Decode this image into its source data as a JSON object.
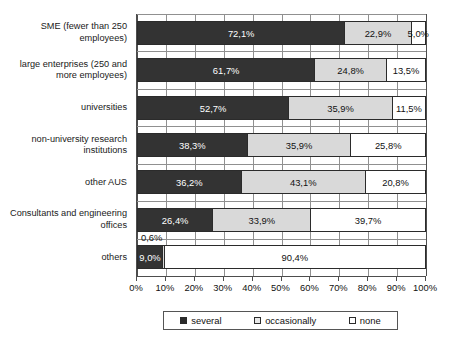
{
  "chart_data": {
    "type": "bar",
    "orientation": "horizontal",
    "stacked": true,
    "title": "",
    "subtitle": "",
    "xlabel": "",
    "ylabel": "",
    "xlim": [
      0,
      100
    ],
    "grid": true,
    "legend_position": "bottom",
    "categories": [
      "SME (fewer than 250 employees)",
      "large enterprises (250 and more employees)",
      "universities",
      "non-university research institutions",
      "other AUS",
      "Consultants and engineering offices",
      "others"
    ],
    "series": [
      {
        "name": "several",
        "values": [
          72.1,
          61.7,
          52.7,
          38.3,
          36.2,
          26.4,
          9.0
        ]
      },
      {
        "name": "occasionally",
        "values": [
          22.9,
          24.8,
          35.9,
          35.9,
          43.1,
          33.9,
          0.6
        ]
      },
      {
        "name": "none",
        "values": [
          5.0,
          13.5,
          11.5,
          25.8,
          20.8,
          39.7,
          90.4
        ]
      }
    ],
    "tick_labels": [
      "0%",
      "10%",
      "20%",
      "30%",
      "40%",
      "50%",
      "60%",
      "70%",
      "80%",
      "90%",
      "100%"
    ],
    "tick_values": [
      0,
      10,
      20,
      30,
      40,
      50,
      60,
      70,
      80,
      90,
      100
    ],
    "colors": {
      "several": "#333333",
      "occasionally": "#d9d9d9",
      "none": "#ffffff",
      "axis": "#4d4d4d",
      "grid": "#909090"
    }
  },
  "categories": [
    {
      "label": "SME (fewer than 250 employees)"
    },
    {
      "label": "large enterprises (250 and more employees)"
    },
    {
      "label": "universities"
    },
    {
      "label": "non-university research institutions"
    },
    {
      "label": "other AUS"
    },
    {
      "label": "Consultants and engineering offices"
    },
    {
      "label": "others"
    }
  ],
  "bars": [
    {
      "several": {
        "value": 72.1,
        "label": "72,1%",
        "inside": true
      },
      "occasionally": {
        "value": 22.9,
        "label": "22,9%",
        "inside": true
      },
      "none": {
        "value": 5.0,
        "label": "5,0%",
        "inside": true
      }
    },
    {
      "several": {
        "value": 61.7,
        "label": "61,7%",
        "inside": true
      },
      "occasionally": {
        "value": 24.8,
        "label": "24,8%",
        "inside": true
      },
      "none": {
        "value": 13.5,
        "label": "13,5%",
        "inside": true
      }
    },
    {
      "several": {
        "value": 52.7,
        "label": "52,7%",
        "inside": true
      },
      "occasionally": {
        "value": 35.9,
        "label": "35,9%",
        "inside": true
      },
      "none": {
        "value": 11.5,
        "label": "11,5%",
        "inside": true
      }
    },
    {
      "several": {
        "value": 38.3,
        "label": "38,3%",
        "inside": true
      },
      "occasionally": {
        "value": 35.9,
        "label": "35,9%",
        "inside": true
      },
      "none": {
        "value": 25.8,
        "label": "25,8%",
        "inside": true
      }
    },
    {
      "several": {
        "value": 36.2,
        "label": "36,2%",
        "inside": true
      },
      "occasionally": {
        "value": 43.1,
        "label": "43,1%",
        "inside": true
      },
      "none": {
        "value": 20.8,
        "label": "20,8%",
        "inside": true
      }
    },
    {
      "several": {
        "value": 26.4,
        "label": "26,4%",
        "inside": true
      },
      "occasionally": {
        "value": 33.9,
        "label": "33,9%",
        "inside": true
      },
      "none": {
        "value": 39.7,
        "label": "39,7%",
        "inside": true
      }
    },
    {
      "several": {
        "value": 9.0,
        "label": "9,0%",
        "inside": true
      },
      "occasionally": {
        "value": 0.6,
        "label": "0,6%",
        "inside": false
      },
      "none": {
        "value": 90.4,
        "label": "90,4%",
        "inside": true
      }
    }
  ],
  "axis": {
    "ticks": [
      {
        "label": "0%",
        "value": 0
      },
      {
        "label": "10%",
        "value": 10
      },
      {
        "label": "20%",
        "value": 20
      },
      {
        "label": "30%",
        "value": 30
      },
      {
        "label": "40%",
        "value": 40
      },
      {
        "label": "50%",
        "value": 50
      },
      {
        "label": "60%",
        "value": 60
      },
      {
        "label": "70%",
        "value": 70
      },
      {
        "label": "80%",
        "value": 80
      },
      {
        "label": "90%",
        "value": 90
      },
      {
        "label": "100%",
        "value": 100
      }
    ]
  },
  "legend": {
    "items": [
      {
        "label": "several",
        "key": "several"
      },
      {
        "label": "occasionally",
        "key": "occasionally"
      },
      {
        "label": "none",
        "key": "none"
      }
    ]
  }
}
